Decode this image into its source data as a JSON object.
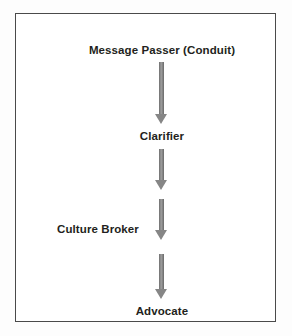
{
  "figure": {
    "frame": {
      "border_color": "#4a4a4a",
      "background_color": "#ffffff"
    },
    "arrow_color": "#868686",
    "text_color": "#231f20",
    "flow": {
      "type": "vertical-flow",
      "direction": "top-to-bottom",
      "nodes": [
        {
          "id": "message-passer",
          "label": "Message Passer (Conduit)",
          "alignment": "center"
        },
        {
          "id": "clarifier",
          "label": "Clarifier",
          "alignment": "center"
        },
        {
          "id": "culture-broker",
          "label": "Culture Broker",
          "alignment": "left-of-axis"
        },
        {
          "id": "advocate",
          "label": "Advocate",
          "alignment": "center"
        }
      ],
      "connectors": [
        {
          "id": "arrow-1",
          "from": "message-passer",
          "to": "clarifier",
          "glyph": "down-arrow"
        },
        {
          "id": "arrow-2",
          "from": "clarifier",
          "to": "culture-broker",
          "glyph": "down-arrow"
        },
        {
          "id": "arrow-3",
          "from": "clarifier",
          "to": "culture-broker",
          "glyph": "down-arrow"
        },
        {
          "id": "arrow-4",
          "from": "culture-broker",
          "to": "advocate",
          "glyph": "down-arrow"
        }
      ]
    }
  }
}
